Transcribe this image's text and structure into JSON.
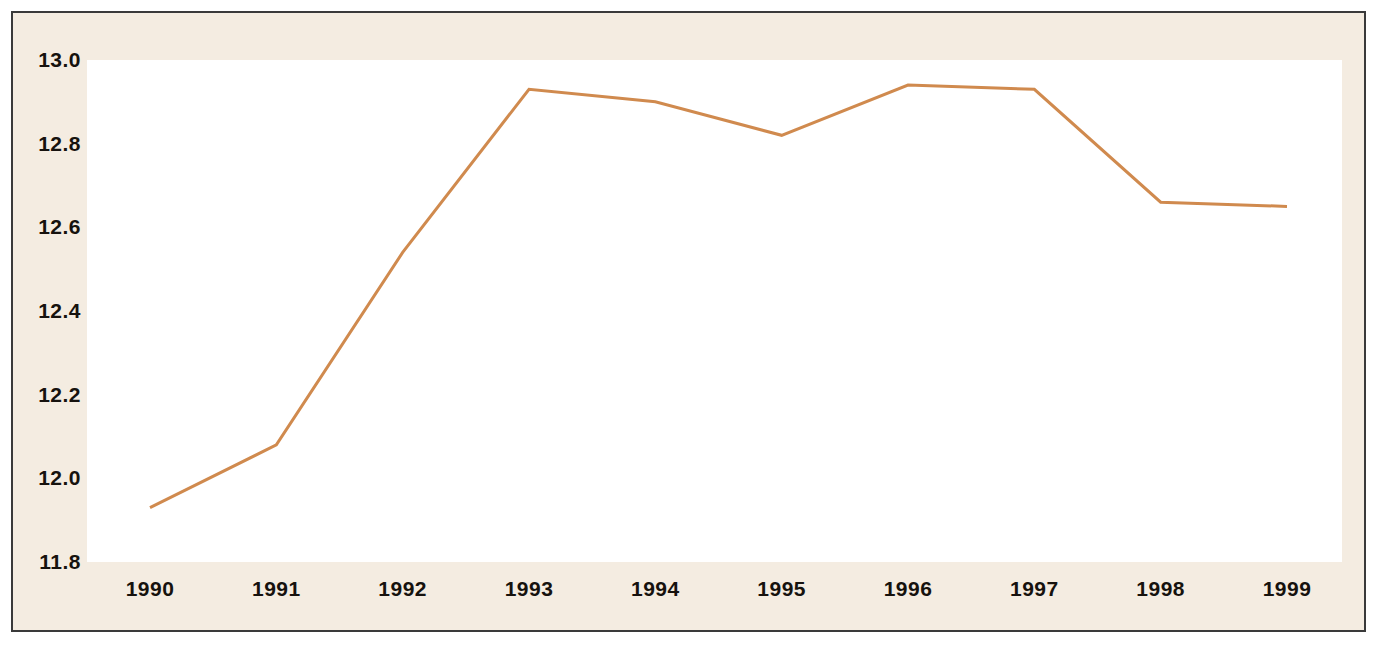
{
  "chart_data": {
    "type": "line",
    "title": "",
    "subtitle": "",
    "xlabel": "",
    "ylabel": "",
    "categories": [
      "1990",
      "1991",
      "1992",
      "1993",
      "1994",
      "1995",
      "1996",
      "1997",
      "1998",
      "1999"
    ],
    "x": [
      1990,
      1991,
      1992,
      1993,
      1994,
      1995,
      1996,
      1997,
      1998,
      1999
    ],
    "series": [
      {
        "name": "",
        "color": "#d08a4e",
        "values": [
          11.93,
          12.08,
          12.54,
          12.93,
          12.9,
          12.82,
          12.94,
          12.93,
          12.66,
          12.65
        ]
      }
    ],
    "values": [
      11.93,
      12.08,
      12.54,
      12.93,
      12.9,
      12.82,
      12.94,
      12.93,
      12.66,
      12.65
    ],
    "ylim": [
      11.8,
      13.0
    ],
    "xlim": [
      1990,
      1999
    ],
    "yticks": [
      "13.0",
      "12.8",
      "12.6",
      "12.4",
      "12.2",
      "12.0",
      "11.8"
    ],
    "ytick_values": [
      13.0,
      12.8,
      12.6,
      12.4,
      12.2,
      12.0,
      11.8
    ],
    "xticks": [
      "1990",
      "1991",
      "1992",
      "1993",
      "1994",
      "1995",
      "1996",
      "1997",
      "1998",
      "1999"
    ],
    "grid": false,
    "legend": "none",
    "markers": false,
    "line_width": 3
  },
  "style": {
    "page_background": "#ffffff",
    "paper_background": "#f4ece1",
    "plot_background": "#ffffff",
    "frame_border_color": "#3a3a3a",
    "line_color": "#d08a4e",
    "tick_label_color": "#16120e"
  }
}
